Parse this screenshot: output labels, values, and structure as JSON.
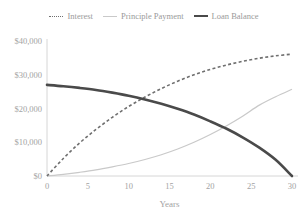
{
  "chart_data": {
    "type": "line",
    "title": "",
    "xlabel": "Years",
    "ylabel": "",
    "xlim": [
      0,
      30
    ],
    "ylim": [
      0,
      40000
    ],
    "grid": false,
    "legend_position": "top-center",
    "x_ticks": [
      "0",
      "5",
      "10",
      "15",
      "20",
      "25",
      "30"
    ],
    "x_tick_values": [
      0,
      5,
      10,
      15,
      20,
      25,
      30
    ],
    "y_ticks": [
      "$0",
      "$10,000",
      "$20,000",
      "$30,000",
      "$40,000"
    ],
    "y_tick_values": [
      0,
      10000,
      20000,
      30000,
      40000
    ],
    "x": [
      0,
      2,
      4,
      6,
      8,
      10,
      12,
      14,
      16,
      18,
      20,
      22,
      24,
      26,
      28,
      30
    ],
    "series": [
      {
        "name": "Interest",
        "style": "dotted",
        "color": "#6f6f6f",
        "values": [
          0,
          5200,
          9800,
          13800,
          17400,
          20600,
          23400,
          25900,
          28100,
          30000,
          31600,
          32900,
          34000,
          34900,
          35600,
          36100
        ]
      },
      {
        "name": "Principle Payment",
        "style": "solid-thin",
        "color": "#c9c9c9",
        "values": [
          0,
          500,
          1100,
          1800,
          2700,
          3700,
          4900,
          6300,
          8000,
          10000,
          12300,
          14900,
          17800,
          21000,
          23500,
          25700
        ]
      },
      {
        "name": "Loan Balance",
        "style": "solid-thick",
        "color": "#4a4a4a",
        "values": [
          27000,
          26600,
          26100,
          25500,
          24700,
          23800,
          22700,
          21400,
          19900,
          18200,
          16200,
          14000,
          11400,
          8400,
          4800,
          0
        ]
      }
    ]
  },
  "legend": {
    "items": [
      {
        "label": "Interest"
      },
      {
        "label": "Principle Payment"
      },
      {
        "label": "Loan Balance"
      }
    ]
  }
}
